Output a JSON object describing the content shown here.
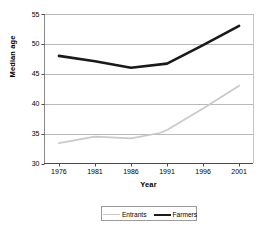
{
  "chart_data": {
    "type": "line",
    "title": "",
    "xlabel": "Year",
    "ylabel": "Median age",
    "x": [
      1976,
      1981,
      1986,
      1991,
      1996,
      2001
    ],
    "xlim": [
      1974,
      2003
    ],
    "ylim": [
      30,
      55
    ],
    "ytick_labels": [
      "30",
      "35",
      "40",
      "45",
      "50",
      "55"
    ],
    "yticks": [
      30,
      35,
      40,
      45,
      50,
      55
    ],
    "xtick_labels": [
      "1976",
      "1981",
      "1986",
      "1991",
      "1996",
      "2001"
    ],
    "grid": "horizontal",
    "legend_position": "bottom",
    "series": [
      {
        "name": "Entrants",
        "color": "#c9c9c9",
        "x": [
          1976,
          1981,
          1986,
          1990,
          1991,
          1996,
          2001
        ],
        "values": [
          33.4,
          34.5,
          34.2,
          35.1,
          35.6,
          39.2,
          43.0
        ]
      },
      {
        "name": "Farmers",
        "color": "#1a1a1a",
        "x": [
          1976,
          1981,
          1986,
          1991,
          1996,
          2001
        ],
        "values": [
          48.0,
          47.1,
          46.0,
          46.7,
          49.8,
          53.0
        ]
      }
    ]
  },
  "legend": {
    "items": [
      {
        "label": "Entrants"
      },
      {
        "label": "Farmers"
      }
    ]
  }
}
